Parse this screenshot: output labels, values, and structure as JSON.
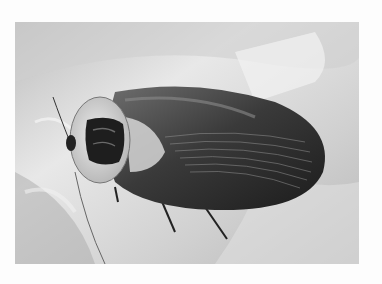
{
  "image": {
    "description": "Black-and-white photograph of a cockroach resting on a leaf",
    "subject": "cockroach",
    "background": "leaf",
    "colors": {
      "border": "#fdfdfd",
      "leaf_light": "#e6e6e6",
      "leaf_mid": "#c4c4c4",
      "leaf_dark": "#8a8a8a",
      "wing_dark": "#2a2a2a",
      "pronotum": "#d9d9d9",
      "head_mark": "#1e1e1e"
    }
  }
}
